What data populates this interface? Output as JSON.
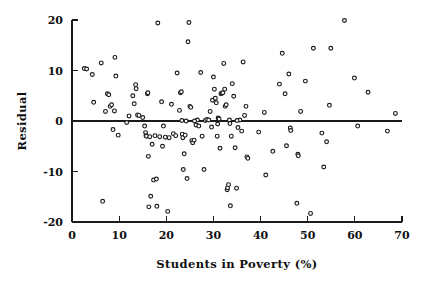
{
  "chart_data": {
    "type": "scatter",
    "title": "",
    "xlabel": "Students in Poverty (%)",
    "ylabel": "Residual",
    "xlim": [
      0,
      70
    ],
    "ylim": [
      -20,
      20
    ],
    "xticks": [
      0,
      10,
      20,
      30,
      40,
      50,
      60,
      70
    ],
    "yticks": [
      -20,
      -10,
      0,
      10,
      20
    ],
    "xtick_labels": [
      "0",
      "10",
      "20",
      "30",
      "40",
      "50",
      "60",
      "70"
    ],
    "ytick_labels": [
      "-20",
      "-10",
      "0",
      "10",
      "20"
    ],
    "grid": false,
    "legend": null,
    "reference_line": {
      "orientation": "horizontal",
      "y": 0,
      "color": "#1a1a1a"
    },
    "marker_style": "open-circle",
    "marker_color": "#1c1c1c",
    "n_points": 148,
    "points": [
      [
        2.6,
        10.4
      ],
      [
        4.3,
        9.2
      ],
      [
        4.6,
        3.7
      ],
      [
        6.2,
        11.5
      ],
      [
        6.5,
        -15.9
      ],
      [
        7.1,
        1.9
      ],
      [
        7.5,
        5.4
      ],
      [
        7.8,
        5.2
      ],
      [
        8.1,
        2.9
      ],
      [
        8.4,
        3.2
      ],
      [
        8.7,
        -1.7
      ],
      [
        9.0,
        2.0
      ],
      [
        9.1,
        12.6
      ],
      [
        9.3,
        8.9
      ],
      [
        9.8,
        -2.8
      ],
      [
        11.6,
        -0.3
      ],
      [
        12.9,
        5.0
      ],
      [
        13.2,
        3.4
      ],
      [
        13.5,
        7.2
      ],
      [
        13.6,
        6.4
      ],
      [
        13.9,
        1.2
      ],
      [
        14.2,
        1.1
      ],
      [
        15.0,
        0.7
      ],
      [
        15.4,
        -1.0
      ],
      [
        15.6,
        -2.3
      ],
      [
        15.7,
        -2.9
      ],
      [
        15.8,
        -3.0
      ],
      [
        16.0,
        5.4
      ],
      [
        16.1,
        5.6
      ],
      [
        16.2,
        -7.0
      ],
      [
        16.3,
        -17.0
      ],
      [
        16.5,
        -3.1
      ],
      [
        16.7,
        -14.9
      ],
      [
        17.0,
        -4.6
      ],
      [
        17.3,
        -11.7
      ],
      [
        17.6,
        -2.9
      ],
      [
        17.9,
        -11.5
      ],
      [
        18.0,
        -16.9
      ],
      [
        18.2,
        19.4
      ],
      [
        18.6,
        -3.1
      ],
      [
        19.0,
        3.8
      ],
      [
        19.4,
        -1.0
      ],
      [
        19.8,
        -3.2
      ],
      [
        20.3,
        -17.9
      ],
      [
        20.6,
        -3.3
      ],
      [
        21.1,
        3.3
      ],
      [
        21.5,
        -2.5
      ],
      [
        22.0,
        -2.9
      ],
      [
        22.3,
        9.5
      ],
      [
        22.8,
        2.1
      ],
      [
        23.0,
        5.6
      ],
      [
        23.2,
        5.8
      ],
      [
        23.3,
        0.1
      ],
      [
        23.4,
        -2.6
      ],
      [
        23.5,
        -3.3
      ],
      [
        23.6,
        -9.6
      ],
      [
        23.8,
        -6.5
      ],
      [
        24.0,
        -2.8
      ],
      [
        24.2,
        0.0
      ],
      [
        24.4,
        -11.4
      ],
      [
        24.6,
        15.7
      ],
      [
        24.8,
        19.5
      ],
      [
        25.0,
        2.9
      ],
      [
        25.2,
        2.7
      ],
      [
        25.4,
        -3.9
      ],
      [
        25.6,
        -4.3
      ],
      [
        25.9,
        -3.8
      ],
      [
        26.3,
        -0.8
      ],
      [
        26.6,
        0.2
      ],
      [
        26.9,
        -1.0
      ],
      [
        27.3,
        9.6
      ],
      [
        27.6,
        -3.0
      ],
      [
        28.0,
        -9.6
      ],
      [
        28.3,
        0.1
      ],
      [
        28.6,
        0.3
      ],
      [
        29.0,
        0.2
      ],
      [
        29.3,
        1.9
      ],
      [
        29.6,
        -1.2
      ],
      [
        29.8,
        4.1
      ],
      [
        30.0,
        8.7
      ],
      [
        30.2,
        6.3
      ],
      [
        30.4,
        4.5
      ],
      [
        30.6,
        3.6
      ],
      [
        30.8,
        -3.0
      ],
      [
        31.0,
        0.6
      ],
      [
        31.2,
        0.4
      ],
      [
        31.4,
        -5.4
      ],
      [
        31.6,
        5.4
      ],
      [
        31.8,
        5.5
      ],
      [
        32.0,
        5.6
      ],
      [
        32.2,
        11.4
      ],
      [
        32.4,
        6.3
      ],
      [
        32.5,
        2.9
      ],
      [
        32.7,
        3.2
      ],
      [
        32.9,
        -13.6
      ],
      [
        33.0,
        -13.2
      ],
      [
        33.2,
        -12.6
      ],
      [
        33.4,
        0.2
      ],
      [
        33.5,
        -0.5
      ],
      [
        33.6,
        -16.8
      ],
      [
        33.8,
        -3.0
      ],
      [
        34.0,
        7.4
      ],
      [
        34.3,
        4.9
      ],
      [
        34.6,
        -5.3
      ],
      [
        34.9,
        -13.3
      ],
      [
        35.2,
        -1.3
      ],
      [
        35.6,
        0.2
      ],
      [
        36.0,
        -2.0
      ],
      [
        36.3,
        11.7
      ],
      [
        36.6,
        1.1
      ],
      [
        36.9,
        2.9
      ],
      [
        37.1,
        -7.1
      ],
      [
        37.3,
        -7.4
      ],
      [
        39.6,
        -2.2
      ],
      [
        40.8,
        1.7
      ],
      [
        41.1,
        -10.7
      ],
      [
        42.6,
        -6.0
      ],
      [
        44.0,
        7.3
      ],
      [
        44.6,
        13.4
      ],
      [
        45.2,
        5.4
      ],
      [
        45.5,
        -4.9
      ],
      [
        46.0,
        9.3
      ],
      [
        46.3,
        -1.4
      ],
      [
        46.4,
        -1.9
      ],
      [
        47.7,
        -16.3
      ],
      [
        47.9,
        -6.6
      ],
      [
        48.0,
        -6.9
      ],
      [
        48.5,
        1.9
      ],
      [
        49.5,
        7.9
      ],
      [
        50.6,
        -18.3
      ],
      [
        51.2,
        14.4
      ],
      [
        53.0,
        -2.4
      ],
      [
        53.4,
        -9.1
      ],
      [
        54.0,
        -4.1
      ],
      [
        54.6,
        3.1
      ],
      [
        54.9,
        14.4
      ],
      [
        57.8,
        19.9
      ],
      [
        59.9,
        8.5
      ],
      [
        60.6,
        -1.0
      ],
      [
        62.8,
        5.7
      ],
      [
        66.9,
        -2.0
      ],
      [
        68.6,
        1.5
      ],
      [
        3.1,
        10.3
      ],
      [
        12.1,
        1.0
      ],
      [
        19.2,
        -5.0
      ],
      [
        26.0,
        0.0
      ],
      [
        30.9,
        -0.6
      ],
      [
        35.0,
        0.1
      ]
    ]
  },
  "figure": {
    "background": "#ffffff",
    "foreground": "#101010"
  }
}
